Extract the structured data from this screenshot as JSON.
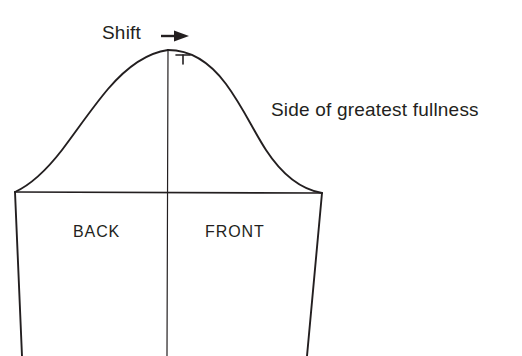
{
  "diagram": {
    "background_color": "#ffffff",
    "line_color": "#231f20",
    "text_color": "#231f20",
    "labels": {
      "shift": "Shift",
      "side_of_greatest_fullness": "Side of greatest fullness",
      "back": "BACK",
      "front": "FRONT"
    },
    "icons": {
      "shift_arrow": "arrow-right-icon",
      "shift_tick": "tick-mark-icon"
    },
    "geometry": {
      "apex": [
        168,
        50
      ],
      "bicep_line_left": [
        15,
        192
      ],
      "bicep_line_right": [
        322,
        193
      ],
      "left_hem": [
        22,
        356
      ],
      "right_hem": [
        307,
        356
      ],
      "grainline_top": [
        168,
        50
      ],
      "grainline_bottom": [
        168,
        356
      ],
      "arrow_start": [
        161,
        36
      ],
      "arrow_end": [
        188,
        36
      ],
      "tick_x": 183,
      "tick_top_y": 55,
      "tick_bottom_y": 63
    }
  }
}
